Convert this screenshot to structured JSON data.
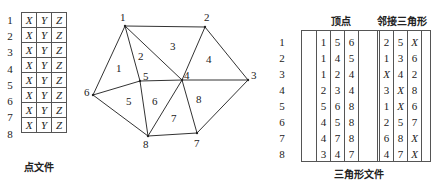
{
  "point_file": {
    "caption": "点文件",
    "rows": [
      {
        "id": "1",
        "cols": [
          "X",
          "Y",
          "Z"
        ]
      },
      {
        "id": "2",
        "cols": [
          "X",
          "Y",
          "Z"
        ]
      },
      {
        "id": "3",
        "cols": [
          "X",
          "Y",
          "Z"
        ]
      },
      {
        "id": "4",
        "cols": [
          "X",
          "Y",
          "Z"
        ]
      },
      {
        "id": "5",
        "cols": [
          "X",
          "Y",
          "Z"
        ]
      },
      {
        "id": "6",
        "cols": [
          "X",
          "Y",
          "Z"
        ]
      },
      {
        "id": "7",
        "cols": [
          "X",
          "Y",
          "Z"
        ]
      },
      {
        "id": "8",
        "cols": [
          "X",
          "Y",
          "Z"
        ]
      }
    ]
  },
  "mesh": {
    "nodes": [
      {
        "id": "1",
        "x": 125,
        "y": 26
      },
      {
        "id": "2",
        "x": 205,
        "y": 27
      },
      {
        "id": "3",
        "x": 248,
        "y": 80
      },
      {
        "id": "4",
        "x": 182,
        "y": 80
      },
      {
        "id": "5",
        "x": 140,
        "y": 81
      },
      {
        "id": "6",
        "x": 93,
        "y": 95
      },
      {
        "id": "7",
        "x": 197,
        "y": 133
      },
      {
        "id": "8",
        "x": 148,
        "y": 136
      }
    ],
    "triangles": [
      {
        "id": "1",
        "label_x": 119,
        "label_y": 71
      },
      {
        "id": "2",
        "label_x": 141,
        "label_y": 60
      },
      {
        "id": "3",
        "label_x": 173,
        "label_y": 49
      },
      {
        "id": "4",
        "label_x": 209,
        "label_y": 62
      },
      {
        "id": "5",
        "label_x": 129,
        "label_y": 104
      },
      {
        "id": "6",
        "label_x": 155,
        "label_y": 104
      },
      {
        "id": "7",
        "label_x": 174,
        "label_y": 121
      },
      {
        "id": "8",
        "label_x": 199,
        "label_y": 102
      }
    ]
  },
  "triangle_file": {
    "caption": "三角形文件",
    "header_vertices": "顶点",
    "header_adjacent": "邻接三角形",
    "rows": [
      {
        "id": "1",
        "vertices": [
          "1",
          "5",
          "6"
        ],
        "adjacent": [
          "2",
          "5",
          "X"
        ]
      },
      {
        "id": "2",
        "vertices": [
          "1",
          "4",
          "5"
        ],
        "adjacent": [
          "1",
          "3",
          "6"
        ]
      },
      {
        "id": "3",
        "vertices": [
          "1",
          "2",
          "4"
        ],
        "adjacent": [
          "X",
          "4",
          "2"
        ]
      },
      {
        "id": "4",
        "vertices": [
          "2",
          "3",
          "4"
        ],
        "adjacent": [
          "3",
          "X",
          "8"
        ]
      },
      {
        "id": "5",
        "vertices": [
          "5",
          "6",
          "8"
        ],
        "adjacent": [
          "1",
          "X",
          "6"
        ]
      },
      {
        "id": "6",
        "vertices": [
          "4",
          "5",
          "8"
        ],
        "adjacent": [
          "2",
          "5",
          "7"
        ]
      },
      {
        "id": "7",
        "vertices": [
          "4",
          "7",
          "8"
        ],
        "adjacent": [
          "6",
          "8",
          "X"
        ]
      },
      {
        "id": "8",
        "vertices": [
          "3",
          "4",
          "7"
        ],
        "adjacent": [
          "4",
          "7",
          "X"
        ]
      }
    ]
  }
}
